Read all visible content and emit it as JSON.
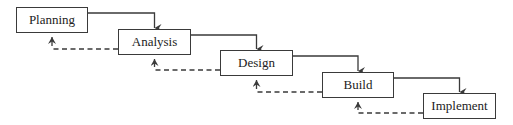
{
  "diagram": {
    "type": "waterfall-model",
    "colors": {
      "stroke": "#3a3a3a",
      "text": "#222222",
      "background": "#ffffff"
    },
    "stages": [
      {
        "label": "Planning",
        "x": 16,
        "y": 7,
        "w": 72,
        "h": 26
      },
      {
        "label": "Analysis",
        "x": 118,
        "y": 29,
        "w": 73,
        "h": 26
      },
      {
        "label": "Design",
        "x": 220,
        "y": 50,
        "w": 73,
        "h": 26
      },
      {
        "label": "Build",
        "x": 322,
        "y": 72,
        "w": 72,
        "h": 26
      },
      {
        "label": "Implement",
        "x": 423,
        "y": 93,
        "w": 73,
        "h": 26
      }
    ],
    "forward_arrows": [
      {
        "from": "Planning",
        "to": "Analysis"
      },
      {
        "from": "Analysis",
        "to": "Design"
      },
      {
        "from": "Design",
        "to": "Build"
      },
      {
        "from": "Build",
        "to": "Implement"
      }
    ],
    "feedback_arrows": [
      {
        "from": "Analysis",
        "to": "Planning",
        "style": "dashed"
      },
      {
        "from": "Design",
        "to": "Analysis",
        "style": "dashed"
      },
      {
        "from": "Build",
        "to": "Design",
        "style": "dashed"
      },
      {
        "from": "Implement",
        "to": "Build",
        "style": "dashed"
      }
    ]
  }
}
